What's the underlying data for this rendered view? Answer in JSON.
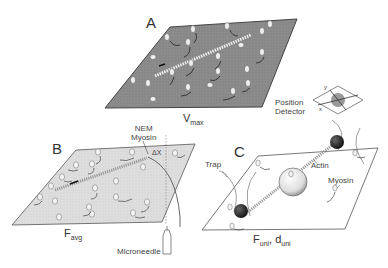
{
  "figure": {
    "panels": [
      {
        "id": "A",
        "label": "A",
        "quantity": "V",
        "quantity_sub": "max",
        "surface": "dark myosin-coated surface with actin filament"
      },
      {
        "id": "B",
        "label": "B",
        "quantity": "F",
        "quantity_sub": "avg",
        "surface": "light myosin-coated surface, actin attached to microneedle"
      },
      {
        "id": "C",
        "label": "C",
        "quantity": "F",
        "quantity_sub": "uni",
        "quantity2": "d",
        "quantity2_sub": "uni",
        "surface": "sparse myosin on pedestal bead, actin held by two trapped beads"
      }
    ],
    "annotations": {
      "nem_myosin": [
        "NEM",
        "Myosin"
      ],
      "delta_x": "ΔX",
      "microneedle": "Microneedle",
      "trap": "Trap",
      "actin": "Actin",
      "myosin": "Myosin",
      "position_detector": [
        "Position",
        "Detector"
      ],
      "axis_x": "x",
      "axis_y": "y"
    },
    "colors": {
      "surface_dark": "#8a8a8a",
      "surface_light": "#dcdcdc",
      "bead": "#1a1a1a",
      "line": "#333333"
    }
  }
}
